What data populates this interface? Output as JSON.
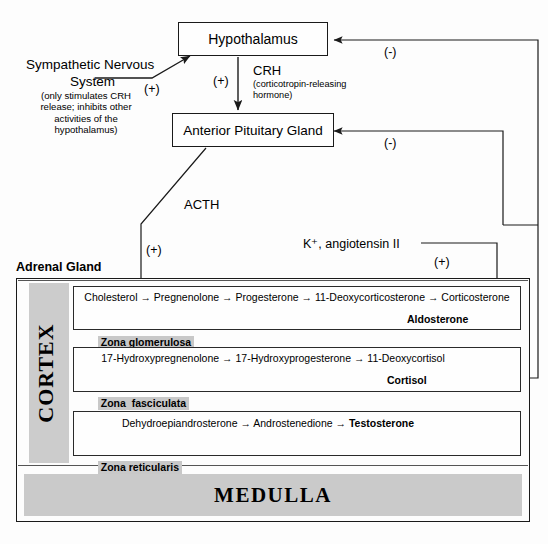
{
  "diagram": {
    "title_adrenal": "Adrenal Gland",
    "nodes": {
      "hypothalamus": "Hypothalamus",
      "pituitary": "Anterior Pituitary Gland",
      "sns_line1": "Sympathetic Nervous",
      "sns_line2": "System",
      "sns_note": "(only stimulates CRH\nrelease; inhibits other\nactivities of the\nhypothalamus)"
    },
    "signals": {
      "crh_abbrev": "CRH",
      "crh_full": "(corticotropin-releasing\nhormone)",
      "acth": "ACTH",
      "stimuli_k_ang": "K⁺, angiotensin II",
      "plus_sns": "(+)",
      "plus_crh": "(+)",
      "plus_acth": "(+)",
      "plus_k_ang": "(+)",
      "minus_hypothalamus": "(-)",
      "minus_pituitary": "(-)"
    },
    "cortex_label": "CORTEX",
    "medulla_label": "MEDULLA",
    "zones": [
      {
        "name": "Zona glomerulosa",
        "pathway": "Cholesterol → Pregnenolone → Progesterone → 11-Deoxycorticosterone → Corticosterone",
        "product": "Aldosterone"
      },
      {
        "name": "Zona  fasciculata",
        "pathway": "17-Hydroxypregnenolone → 17-Hydroxyprogesterone → 11-Deoxycortisol",
        "product": "Cortisol"
      },
      {
        "name": "Zona reticularis",
        "pathway_pre": "Dehydroepiandrosterone → Androstenedione → ",
        "pathway_bold": "Testosterone",
        "product": ""
      }
    ],
    "colors": {
      "stroke": "#1a1a1a",
      "highlight": "#c8c8c8",
      "grey_bar": "#cccccc",
      "paper": "#fdfdfd"
    }
  }
}
